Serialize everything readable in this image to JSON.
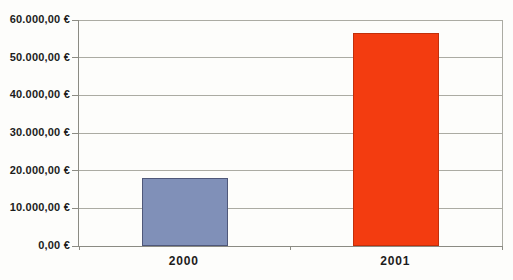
{
  "chart_data": {
    "type": "bar",
    "title": "",
    "xlabel": "",
    "ylabel": "",
    "categories": [
      "2000",
      "2001"
    ],
    "values": [
      18000,
      56500
    ],
    "value_labels": [
      "18.000,00 €",
      "56.500,00 €"
    ],
    "ylim": [
      0,
      60000
    ],
    "y_tick_interval": 10000,
    "y_tick_labels": [
      "0,00 €",
      "10.000,00 €",
      "20.000,00 €",
      "30.000,00 €",
      "40.000,00 €",
      "50.000,00 €",
      "60.000,00 €"
    ],
    "grid": "horizontal",
    "legend": "none",
    "series_colors": [
      "#8090B8",
      "#F33C10"
    ],
    "bar_border_colors": [
      "#4F587A",
      "#C22F0A"
    ],
    "grid_color": "#ABABA3",
    "axis_color": "#8B8B83",
    "label_color": "#1C1C1C",
    "background_color": "#FDFDFB"
  }
}
